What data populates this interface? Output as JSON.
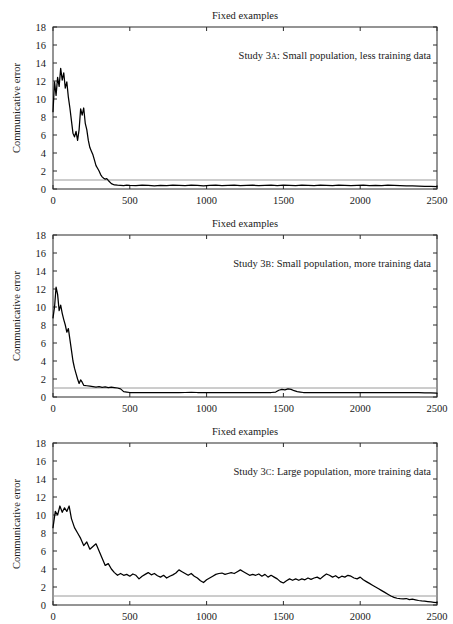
{
  "figure": {
    "width": 453,
    "height": 624,
    "background": "#ffffff",
    "panel_count": 3
  },
  "style": {
    "series_color": "#000000",
    "reference_line_color": "#9a9a9a",
    "axis_color": "#2a2a2a",
    "text_color": "#1a1a1a"
  },
  "chart_data": [
    {
      "type": "line",
      "title": "Fixed examples",
      "xlabel": "",
      "ylabel": "Communicative error",
      "annotation": "Study 3A: Small population, less training data",
      "annotation_prefix": "Study 3",
      "annotation_smallcap": "A",
      "annotation_suffix": ": Small population, less training data",
      "xlim": [
        0,
        2500
      ],
      "ylim": [
        0,
        18
      ],
      "xticks": [
        0,
        500,
        1000,
        1500,
        2000,
        2500
      ],
      "yticks": [
        0,
        2,
        4,
        6,
        8,
        10,
        12,
        14,
        16,
        18
      ],
      "xtick_labels": [
        "0",
        "500",
        "1000",
        "1500",
        "2000",
        "2500"
      ],
      "ytick_labels": [
        "0",
        "2",
        "4",
        "6",
        "8",
        "10",
        "12",
        "14",
        "16",
        "18"
      ],
      "grid": false,
      "reference_line_y": 1.0,
      "series": [
        {
          "name": "communicative error",
          "x": [
            0,
            10,
            20,
            30,
            40,
            50,
            60,
            70,
            80,
            90,
            100,
            110,
            120,
            130,
            140,
            150,
            160,
            170,
            180,
            190,
            200,
            210,
            220,
            230,
            240,
            250,
            260,
            270,
            280,
            290,
            300,
            310,
            320,
            330,
            340,
            350,
            360,
            380,
            400,
            420,
            440,
            460,
            480,
            500,
            540,
            580,
            620,
            660,
            700,
            740,
            780,
            820,
            860,
            900,
            940,
            980,
            1020,
            1060,
            1100,
            1140,
            1180,
            1220,
            1260,
            1300,
            1340,
            1380,
            1420,
            1460,
            1500,
            1540,
            1580,
            1620,
            1660,
            1700,
            1740,
            1780,
            1820,
            1860,
            1900,
            1940,
            1980,
            2020,
            2060,
            2100,
            2140,
            2180,
            2220,
            2260,
            2300,
            2340,
            2380,
            2420,
            2460,
            2500
          ],
          "y": [
            8.6,
            11.9,
            10.4,
            12.4,
            11.4,
            13.4,
            12.1,
            12.9,
            11.2,
            11.9,
            10.2,
            9.0,
            7.6,
            6.2,
            5.8,
            6.4,
            5.4,
            6.6,
            8.9,
            8.2,
            9.0,
            7.3,
            6.6,
            5.4,
            4.6,
            4.2,
            3.8,
            3.2,
            2.6,
            2.3,
            2.0,
            1.6,
            1.35,
            1.2,
            1.1,
            1.15,
            0.95,
            0.6,
            0.45,
            0.42,
            0.4,
            0.38,
            0.42,
            0.4,
            0.38,
            0.42,
            0.4,
            0.36,
            0.4,
            0.38,
            0.42,
            0.4,
            0.38,
            0.42,
            0.4,
            0.36,
            0.4,
            0.42,
            0.38,
            0.4,
            0.42,
            0.38,
            0.4,
            0.42,
            0.38,
            0.4,
            0.42,
            0.38,
            0.42,
            0.4,
            0.38,
            0.42,
            0.4,
            0.38,
            0.42,
            0.4,
            0.38,
            0.42,
            0.4,
            0.38,
            0.4,
            0.42,
            0.38,
            0.4,
            0.38,
            0.42,
            0.4,
            0.38,
            0.36,
            0.34,
            0.32,
            0.3,
            0.28,
            0.26
          ]
        }
      ]
    },
    {
      "type": "line",
      "title": "Fixed examples",
      "xlabel": "",
      "ylabel": "Communicative error",
      "annotation": "Study 3B: Small population, more training data",
      "annotation_prefix": "Study 3",
      "annotation_smallcap": "B",
      "annotation_suffix": ": Small population, more training data",
      "xlim": [
        0,
        2500
      ],
      "ylim": [
        0,
        18
      ],
      "xticks": [
        0,
        500,
        1000,
        1500,
        2000,
        2500
      ],
      "yticks": [
        0,
        2,
        4,
        6,
        8,
        10,
        12,
        14,
        16,
        18
      ],
      "xtick_labels": [
        "0",
        "500",
        "1000",
        "1500",
        "2000",
        "2500"
      ],
      "ytick_labels": [
        "0",
        "2",
        "4",
        "6",
        "8",
        "10",
        "12",
        "14",
        "16",
        "18"
      ],
      "grid": false,
      "reference_line_y": 1.0,
      "series": [
        {
          "name": "communicative error",
          "x": [
            0,
            10,
            20,
            30,
            40,
            50,
            60,
            70,
            80,
            90,
            100,
            110,
            120,
            130,
            140,
            150,
            160,
            170,
            180,
            190,
            200,
            220,
            240,
            260,
            280,
            300,
            320,
            340,
            360,
            380,
            400,
            420,
            440,
            460,
            480,
            500,
            540,
            580,
            620,
            660,
            700,
            740,
            780,
            820,
            860,
            900,
            940,
            980,
            1020,
            1060,
            1100,
            1140,
            1180,
            1220,
            1260,
            1300,
            1340,
            1380,
            1420,
            1450,
            1470,
            1490,
            1510,
            1530,
            1550,
            1570,
            1590,
            1610,
            1630,
            1660,
            1700,
            1740,
            1780,
            1820,
            1860,
            1900,
            1940,
            1980,
            2020,
            2060,
            2100,
            2140,
            2180,
            2220,
            2260,
            2300,
            2340,
            2380,
            2420,
            2460,
            2500
          ],
          "y": [
            8.8,
            10.0,
            12.2,
            11.4,
            9.6,
            10.2,
            9.3,
            8.6,
            8.0,
            7.2,
            7.6,
            6.4,
            5.2,
            4.0,
            3.2,
            2.6,
            2.0,
            1.5,
            1.9,
            1.65,
            1.3,
            1.25,
            1.2,
            1.15,
            1.1,
            1.15,
            1.08,
            1.12,
            1.05,
            1.1,
            1.05,
            1.0,
            0.9,
            0.6,
            0.55,
            0.5,
            0.5,
            0.5,
            0.5,
            0.5,
            0.5,
            0.5,
            0.5,
            0.48,
            0.5,
            0.52,
            0.5,
            0.5,
            0.48,
            0.5,
            0.5,
            0.5,
            0.5,
            0.5,
            0.5,
            0.5,
            0.5,
            0.5,
            0.5,
            0.55,
            0.75,
            0.85,
            0.8,
            0.9,
            0.85,
            0.7,
            0.6,
            0.55,
            0.5,
            0.5,
            0.5,
            0.48,
            0.5,
            0.5,
            0.5,
            0.48,
            0.5,
            0.5,
            0.5,
            0.48,
            0.5,
            0.5,
            0.5,
            0.48,
            0.5,
            0.48,
            0.5,
            0.48,
            0.46,
            0.45,
            0.44,
            0.43
          ]
        }
      ]
    },
    {
      "type": "line",
      "title": "Fixed examples",
      "xlabel": "",
      "ylabel": "Communicative error",
      "annotation": "Study 3C: Large population, more training data",
      "annotation_prefix": "Study 3",
      "annotation_smallcap": "C",
      "annotation_suffix": ": Large population, more training data",
      "xlim": [
        0,
        2500
      ],
      "ylim": [
        0,
        18
      ],
      "xticks": [
        0,
        500,
        1000,
        1500,
        2000,
        2500
      ],
      "yticks": [
        0,
        2,
        4,
        6,
        8,
        10,
        12,
        14,
        16,
        18
      ],
      "xtick_labels": [
        "0",
        "500",
        "1000",
        "1500",
        "2000",
        "2500"
      ],
      "ytick_labels": [
        "0",
        "2",
        "4",
        "6",
        "8",
        "10",
        "12",
        "14",
        "16",
        "18"
      ],
      "grid": false,
      "reference_line_y": 1.0,
      "series": [
        {
          "name": "communicative error",
          "x": [
            0,
            15,
            30,
            45,
            60,
            75,
            90,
            105,
            120,
            140,
            160,
            180,
            200,
            220,
            240,
            260,
            280,
            300,
            320,
            340,
            360,
            380,
            400,
            420,
            440,
            460,
            480,
            500,
            520,
            540,
            560,
            580,
            600,
            620,
            640,
            660,
            680,
            700,
            720,
            740,
            760,
            780,
            800,
            820,
            840,
            860,
            880,
            900,
            920,
            940,
            960,
            980,
            1000,
            1020,
            1040,
            1060,
            1080,
            1100,
            1120,
            1140,
            1160,
            1180,
            1200,
            1220,
            1240,
            1260,
            1280,
            1300,
            1320,
            1340,
            1360,
            1380,
            1400,
            1420,
            1440,
            1460,
            1480,
            1500,
            1520,
            1540,
            1560,
            1580,
            1600,
            1620,
            1640,
            1660,
            1680,
            1700,
            1720,
            1740,
            1760,
            1780,
            1800,
            1820,
            1840,
            1860,
            1880,
            1900,
            1920,
            1940,
            1960,
            1980,
            2000,
            2020,
            2040,
            2060,
            2080,
            2100,
            2120,
            2140,
            2160,
            2180,
            2200,
            2220,
            2240,
            2260,
            2280,
            2300,
            2320,
            2340,
            2360,
            2380,
            2400,
            2420,
            2440,
            2460,
            2480,
            2500
          ],
          "y": [
            8.6,
            10.4,
            10.0,
            11.0,
            10.3,
            10.8,
            10.4,
            11.0,
            9.6,
            8.6,
            8.0,
            7.4,
            6.6,
            7.0,
            6.2,
            6.5,
            6.8,
            6.0,
            5.2,
            4.4,
            4.6,
            4.0,
            3.6,
            3.3,
            3.5,
            3.3,
            3.4,
            3.2,
            3.45,
            3.3,
            2.9,
            3.2,
            3.4,
            3.6,
            3.35,
            3.5,
            3.25,
            3.1,
            3.3,
            3.0,
            3.2,
            3.35,
            3.55,
            3.9,
            3.7,
            3.5,
            3.3,
            3.5,
            3.2,
            3.0,
            2.7,
            2.5,
            2.8,
            3.0,
            3.2,
            3.4,
            3.5,
            3.55,
            3.4,
            3.5,
            3.6,
            3.5,
            3.7,
            3.9,
            3.7,
            3.5,
            3.3,
            3.4,
            3.3,
            3.45,
            3.2,
            3.4,
            3.1,
            3.3,
            3.1,
            2.9,
            2.6,
            2.45,
            2.7,
            2.9,
            2.75,
            2.9,
            2.75,
            2.9,
            2.8,
            3.0,
            2.85,
            3.0,
            3.1,
            2.9,
            3.2,
            3.45,
            3.3,
            3.1,
            3.25,
            3.0,
            3.2,
            3.1,
            3.3,
            3.2,
            3.0,
            2.9,
            3.1,
            2.8,
            2.6,
            2.4,
            2.2,
            2.0,
            1.8,
            1.6,
            1.4,
            1.2,
            1.0,
            0.85,
            0.75,
            0.7,
            0.68,
            0.72,
            0.6,
            0.65,
            0.58,
            0.5,
            0.45,
            0.42,
            0.38,
            0.34,
            0.3,
            0.26,
            0.22
          ]
        }
      ]
    }
  ]
}
